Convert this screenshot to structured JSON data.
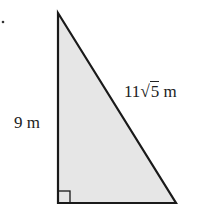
{
  "diagram": {
    "type": "right-triangle",
    "labels": {
      "leg": "9 m",
      "hypotenuse_coef": "11",
      "hypotenuse_radicand": "5",
      "hypotenuse_unit": " m"
    },
    "colors": {
      "fill": "#e6e6e6",
      "stroke": "#1a1a1a"
    }
  }
}
